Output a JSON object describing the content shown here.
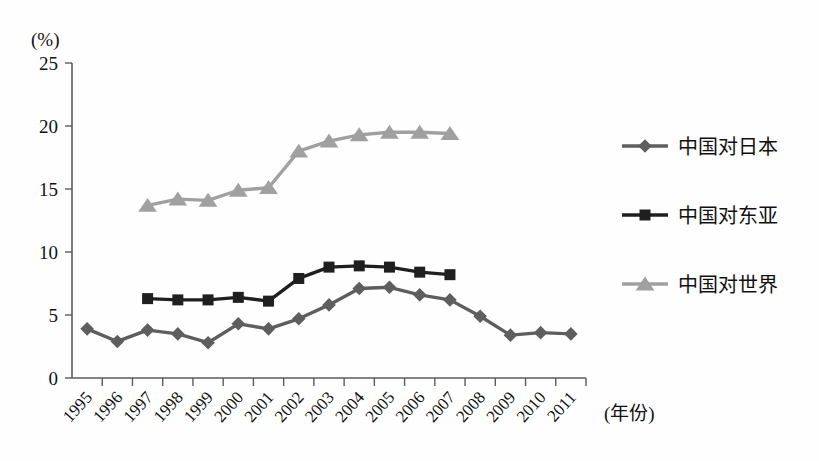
{
  "chart_data": {
    "type": "line",
    "title": "",
    "subtitle": "",
    "xlabel": "(年份)",
    "ylabel": "(%)",
    "ylim": [
      0,
      25
    ],
    "yticks": [
      0,
      5,
      10,
      15,
      20,
      25
    ],
    "ytick_labels": [
      "0",
      "5",
      "10",
      "15",
      "20",
      "25"
    ],
    "grid": false,
    "legend_position": "right",
    "x": [
      1995,
      1996,
      1997,
      1998,
      1999,
      2000,
      2001,
      2002,
      2003,
      2004,
      2005,
      2006,
      2007,
      2008,
      2009,
      2010,
      2011
    ],
    "categories": [
      "1995",
      "1996",
      "1997",
      "1998",
      "1999",
      "2000",
      "2001",
      "2002",
      "2003",
      "2004",
      "2005",
      "2006",
      "2007",
      "2008",
      "2009",
      "2010",
      "2011"
    ],
    "series": [
      {
        "name": "中国对日本",
        "marker": "diamond",
        "color": "#5e5e5e",
        "values": [
          3.9,
          2.9,
          3.8,
          3.5,
          2.8,
          4.3,
          3.9,
          4.7,
          5.8,
          7.1,
          7.2,
          6.6,
          6.2,
          4.9,
          3.4,
          3.6,
          3.5
        ]
      },
      {
        "name": "中国对东亚",
        "marker": "square",
        "color": "#1f1f1f",
        "values": [
          null,
          null,
          6.3,
          6.2,
          6.2,
          6.4,
          6.1,
          7.9,
          8.8,
          8.9,
          8.8,
          8.4,
          8.2,
          null,
          null,
          null,
          null
        ]
      },
      {
        "name": "中国对世界",
        "marker": "triangle",
        "color": "#a0a0a0",
        "values": [
          null,
          null,
          13.7,
          14.2,
          14.1,
          14.9,
          15.1,
          18.0,
          18.8,
          19.3,
          19.5,
          19.5,
          19.4,
          null,
          null,
          null,
          null
        ]
      }
    ]
  },
  "axes": {
    "y_unit_label": "(%)",
    "x_axis_name": "(年份)"
  },
  "legend": {
    "items": [
      {
        "label": "中国对日本",
        "marker": "diamond-marker",
        "color": "#5e5e5e"
      },
      {
        "label": "中国对东亚",
        "marker": "square-marker",
        "color": "#1f1f1f"
      },
      {
        "label": "中国对世界",
        "marker": "triangle-marker",
        "color": "#a0a0a0"
      }
    ]
  }
}
